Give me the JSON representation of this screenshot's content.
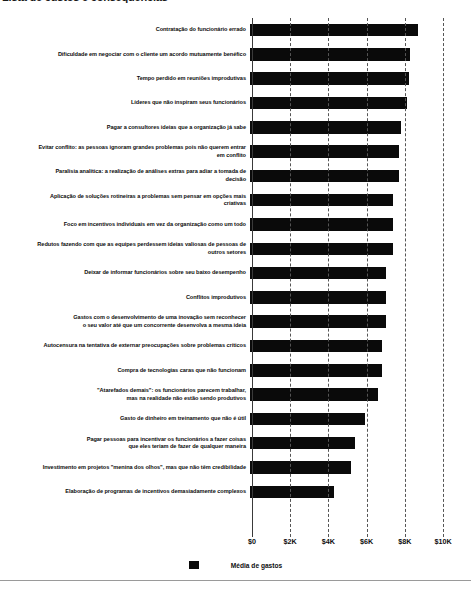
{
  "title": {
    "text": "Lista de custos e consequências"
  },
  "legend": {
    "label": "Média de gastos",
    "swatch_color": "#0a0a0a",
    "position": "bottom-center"
  },
  "axis": {
    "tick_labels": [
      "$0",
      "$2K",
      "$4K",
      "$6K",
      "$8K",
      "$10K"
    ]
  },
  "chart_data": {
    "type": "bar",
    "orientation": "horizontal",
    "title": "Lista de custos e consequências",
    "xlabel": "",
    "ylabel": "",
    "xlim": [
      0,
      10000
    ],
    "grid": true,
    "legend_position": "bottom-center",
    "series": [
      {
        "name": "Média de gastos",
        "color": "#0a0a0a",
        "values": [
          8800,
          8400,
          8300,
          8200,
          7900,
          7800,
          7800,
          7500,
          7500,
          7500,
          7100,
          7100,
          7100,
          6900,
          6900,
          6700,
          6000,
          5500,
          5300,
          4400
        ]
      }
    ],
    "categories": [
      "Contratação do funcionário errado",
      "Dificuldade em negociar com o cliente um acordo mutuamente benéfico",
      "Tempo perdido em reuniões improdutivas",
      "Líderes que não inspiram seus funcionários",
      "Pagar a consultores ideias que a organização já sabe",
      "Evitar conflito: as pessoas ignoram grandes problemas pois não querem entrar em conflito",
      "Paralisia analítica: a realização de análises extras para adiar a tomada de decisão",
      "Aplicação de soluções rotineiras a problemas sem pensar em opções mais criativas",
      "Foco em incentivos individuais em vez da organização como um todo",
      "Redutos fazendo com que as equipes perdessem ideias valiosas de pessoas de outros setores",
      "Deixar de informar funcionários sobre seu baixo desempenho",
      "Conflitos improdutivos",
      "Gastos com o desenvolvimento de uma inovação sem reconhecer o seu valor até que um concorrente desenvolva a mesma ideia",
      "Autocensura na tentativa de externar preocupações sobre problemas críticos",
      "Compra de tecnologias caras que não funcionam",
      "\"Atarefados demais\": os funcionários parecem trabalhar, mas na realidade não estão sendo produtivos",
      "Gasto de dinheiro em treinamento que não é útil",
      "Pagar pessoas para incentivar os funcionários a fazer coisas que eles teriam de fazer de qualquer maneira",
      "Investimento em projetos \"menina dos olhos\", mas que não têm credibilidade",
      "Elaboração de programas de incentivos demasiadamente complexos"
    ],
    "tick_values": [
      0,
      2000,
      4000,
      6000,
      8000,
      10000
    ],
    "tick_labels": [
      "$0",
      "$2K",
      "$4K",
      "$6K",
      "$8K",
      "$10K"
    ]
  },
  "rows": [
    {
      "label": "Contratação do funcionário errado",
      "value": 8800
    },
    {
      "label": "Dificuldade em negociar com o cliente um acordo mutuamente benéfico",
      "value": 8400
    },
    {
      "label": "Tempo perdido em reuniões improdutivas",
      "value": 8300
    },
    {
      "label": "Líderes que não inspiram seus funcionários",
      "value": 8200
    },
    {
      "label": "Pagar a consultores ideias que a organização já sabe",
      "value": 7900
    },
    {
      "label": "Evitar conflito: as pessoas ignoram grandes problemas pois não querem entrar\nem conflito",
      "value": 7800
    },
    {
      "label": "Paralisia analítica: a realização de análises extras para adiar a tomada de\ndecisão",
      "value": 7800
    },
    {
      "label": "Aplicação de soluções rotineiras a problemas sem pensar em opções mais\ncriativas",
      "value": 7500
    },
    {
      "label": "Foco em incentivos individuais em vez da organização como um todo",
      "value": 7500
    },
    {
      "label": "Redutos fazendo com que as equipes perdessem ideias valiosas de pessoas de\noutros setores",
      "value": 7500
    },
    {
      "label": "Deixar de informar funcionários sobre seu baixo desempenho",
      "value": 7100
    },
    {
      "label": "Conflitos improdutivos",
      "value": 7100
    },
    {
      "label": "Gastos com o desenvolvimento de uma inovação sem reconhecer\no seu valor até que um concorrente desenvolva a mesma ideia",
      "value": 7100
    },
    {
      "label": "Autocensura na tentativa de externar preocupações sobre problemas críticos",
      "value": 6900
    },
    {
      "label": "Compra de tecnologias caras que não funcionam",
      "value": 6900
    },
    {
      "label": "\"Atarefados demais\": os funcionários parecem trabalhar,\nmas na realidade não estão sendo produtivos",
      "value": 6700
    },
    {
      "label": "Gasto de dinheiro em treinamento que não é útil",
      "value": 6000
    },
    {
      "label": "Pagar pessoas para incentivar os funcionários a fazer coisas\nque eles teriam de fazer de qualquer maneira",
      "value": 5500
    },
    {
      "label": "Investimento em projetos \"menina dos olhos\", mas que não têm credibilidade",
      "value": 5300
    },
    {
      "label": "Elaboração de programas de incentivos demasiadamente complexos",
      "value": 4400
    }
  ]
}
